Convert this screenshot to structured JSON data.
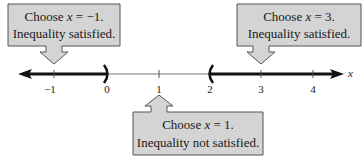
{
  "number_line": {
    "variable": "x",
    "ticks": [
      {
        "value": -1,
        "label": "−1"
      },
      {
        "value": 0,
        "label": "0"
      },
      {
        "value": 1,
        "label": "1"
      },
      {
        "value": 2,
        "label": "2"
      },
      {
        "value": 3,
        "label": "3"
      },
      {
        "value": 4,
        "label": "4"
      }
    ],
    "open_endpoints": [
      {
        "value": 0,
        "type": "right-paren"
      },
      {
        "value": 2,
        "type": "left-paren"
      }
    ],
    "shaded_intervals": [
      {
        "from": "-inf",
        "to": 0
      },
      {
        "from": 2,
        "to": "inf"
      }
    ]
  },
  "callouts": [
    {
      "id": "left",
      "line1_prefix": "Choose ",
      "var": "x",
      "line1_suffix": " = −1.",
      "line2": "Inequality satisfied.",
      "points_to": -1
    },
    {
      "id": "right",
      "line1_prefix": "Choose ",
      "var": "x",
      "line1_suffix": " = 3.",
      "line2": "Inequality satisfied.",
      "points_to": 3
    },
    {
      "id": "bottom",
      "line1_prefix": "Choose ",
      "var": "x",
      "line1_suffix": " = 1.",
      "line2": "Inequality not satisfied.",
      "points_to": 1
    }
  ],
  "colors": {
    "callout_fill": "#d4d4d4",
    "callout_stroke": "#555555",
    "line_thick": "#111111",
    "line_thin": "#666666"
  }
}
